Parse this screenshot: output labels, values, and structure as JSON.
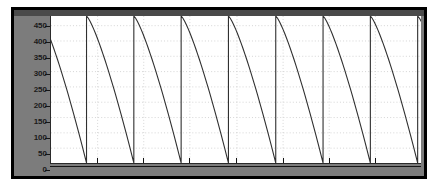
{
  "window": {
    "kind": "oscilloscope-scope-window",
    "frame_color": "#000000",
    "panel_color": "#7c7c7c",
    "plot_background": "#ffffff"
  },
  "chart_data": {
    "type": "line",
    "title": "",
    "subtitle": "",
    "xlabel": "",
    "ylabel": "",
    "waveform": "sawtooth-decay",
    "series": [
      {
        "name": "signal",
        "color": "#303030",
        "line_width": 1.1
      }
    ],
    "y_ticks": [
      0,
      50,
      100,
      150,
      200,
      250,
      300,
      350,
      400,
      450
    ],
    "y_tick_labels": [
      "0",
      "50",
      "100",
      "150",
      "200",
      "250",
      "300",
      "350",
      "400",
      "450"
    ],
    "ylim": [
      0,
      480
    ],
    "xlim": [
      0,
      7.78
    ],
    "x_ticks": [],
    "x_tick_labels": [],
    "grid": true,
    "grid_style": "dotted",
    "grid_color": "#c8c8c8",
    "grid_vertical_count": 7,
    "legend": "none",
    "peak_value": 480,
    "trough_value": 0,
    "cycle_count": 8,
    "period_px": 48.2,
    "first_peak_offset_px": -12
  }
}
